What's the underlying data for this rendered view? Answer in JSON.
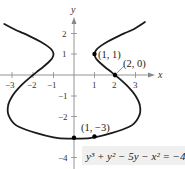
{
  "chart_data": {
    "type": "line",
    "title": "",
    "xlabel": "x",
    "ylabel": "y",
    "xlim": [
      -3.6,
      3.8
    ],
    "ylim": [
      -4.5,
      2.9
    ],
    "grid": false,
    "x_ticks": [
      -3,
      -2,
      -1,
      1,
      2,
      3
    ],
    "x_tick_labels": [
      "-3",
      "-2",
      "-1",
      "1",
      "2",
      "3"
    ],
    "y_ticks": [
      -4,
      -2,
      -1,
      1,
      2
    ],
    "y_tick_labels": [
      "-4",
      "-2",
      "-1",
      "1",
      "2"
    ],
    "equation": "y³ + y² − 5y − x² = −4",
    "curve": {
      "name": "y^3 + y^2 - 5y - x^2 = -4",
      "points": [
        [
          3.46,
          2.55
        ],
        [
          2.91,
          2.2
        ],
        [
          2.449,
          2
        ],
        [
          2.018,
          1.8
        ],
        [
          1.63,
          1.6
        ],
        [
          1.305,
          1.4
        ],
        [
          1.081,
          1.2
        ],
        [
          1,
          1
        ],
        [
          1.073,
          0.8
        ],
        [
          1.255,
          0.6
        ],
        [
          1.491,
          0.4
        ],
        [
          1.746,
          0.2
        ],
        [
          2,
          0
        ],
        [
          2.574,
          -0.5
        ],
        [
          3,
          -1
        ],
        [
          3.221,
          -1.5
        ],
        [
          3.162,
          -2
        ],
        [
          2.669,
          -2.5
        ],
        [
          1,
          -3
        ],
        [
          0,
          -3.06
        ],
        [
          -1,
          -3
        ],
        [
          -2.669,
          -2.5
        ],
        [
          -3.162,
          -2
        ],
        [
          -3.221,
          -1.5
        ],
        [
          -3,
          -1
        ],
        [
          -2.574,
          -0.5
        ],
        [
          -2,
          0
        ],
        [
          -1.746,
          0.2
        ],
        [
          -1.491,
          0.4
        ],
        [
          -1.255,
          0.6
        ],
        [
          -1.073,
          0.8
        ],
        [
          -1,
          1
        ],
        [
          -1.081,
          1.2
        ],
        [
          -1.305,
          1.4
        ],
        [
          -1.63,
          1.6
        ],
        [
          -2.018,
          1.8
        ],
        [
          -2.449,
          2
        ],
        [
          -2.91,
          2.2
        ],
        [
          -3.4,
          2.45
        ]
      ]
    },
    "marked_points": [
      {
        "x": 1,
        "y": 1,
        "label": "(1, 1)"
      },
      {
        "x": 2,
        "y": 0,
        "label": "(2, 0)"
      },
      {
        "x": 1,
        "y": -3,
        "label": "(1, −3)"
      },
      {
        "x": 0,
        "y": -3.06,
        "label": ""
      }
    ]
  },
  "labels": {
    "x_axis": "x",
    "y_axis": "y",
    "equation_text": "y³ + y² − 5y − x² = −4",
    "point_1_1": "(1, 1)",
    "point_2_0": "(2, 0)",
    "point_1_m3": "(1, −3)",
    "tick_x_m3": "−3",
    "tick_x_m2": "−2",
    "tick_x_m1": "−1",
    "tick_x_1": "1",
    "tick_x_2": "2",
    "tick_x_3": "3",
    "tick_y_2": "2",
    "tick_y_1": "1",
    "tick_y_m1": "−1",
    "tick_y_m2": "−2",
    "tick_y_m4": "−4"
  },
  "colors": {
    "curve": "#1a1a1a",
    "axis": "#888888",
    "text": "#333333",
    "equation_bg": "#f0f0f0"
  }
}
